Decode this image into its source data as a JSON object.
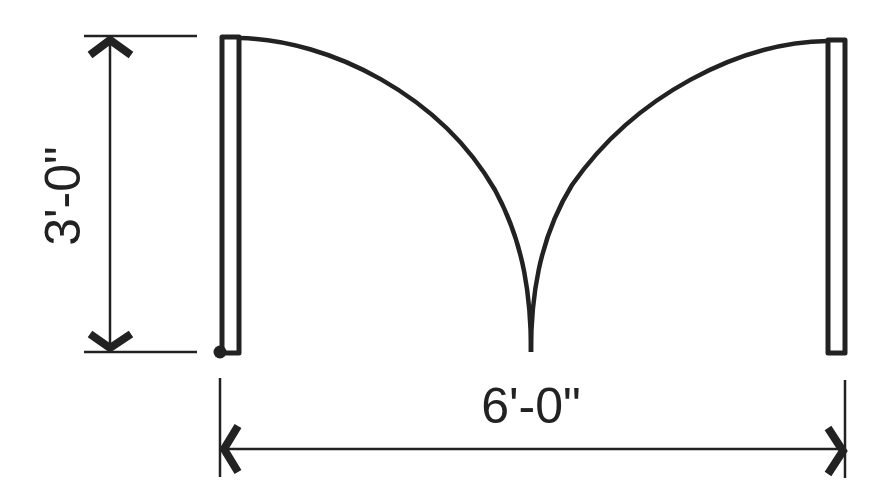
{
  "diagram": {
    "colors": {
      "line": "#222222",
      "background": "#ffffff"
    },
    "dimensions": {
      "height_label": "3'-0\"",
      "width_label": "6'-0\""
    },
    "elements": [
      {
        "name": "left-door-leaf",
        "type": "rect"
      },
      {
        "name": "right-door-leaf",
        "type": "rect"
      },
      {
        "name": "left-swing-arc",
        "type": "arc"
      },
      {
        "name": "right-swing-arc",
        "type": "arc"
      },
      {
        "name": "hinge-point",
        "type": "dot"
      },
      {
        "name": "vertical-dimension",
        "label": "3'-0\""
      },
      {
        "name": "horizontal-dimension",
        "label": "6'-0\""
      }
    ]
  }
}
